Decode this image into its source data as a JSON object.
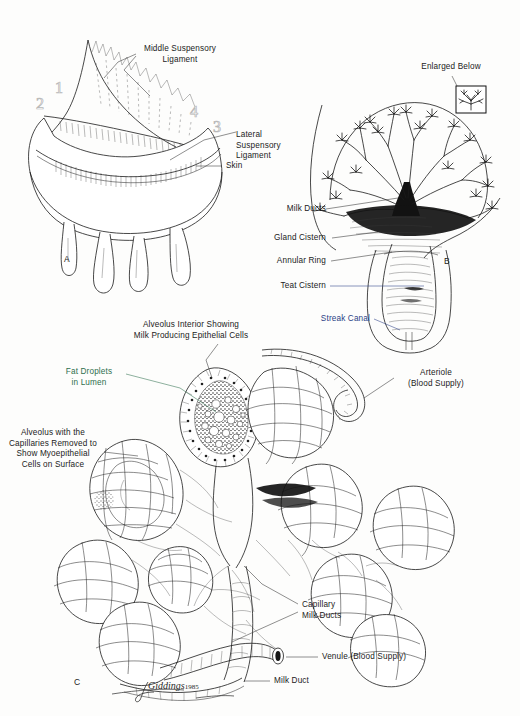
{
  "figure": {
    "artist_signature": "Giddings",
    "artist_year": "1985",
    "background_color": "#fdfdfc",
    "ink_color": "#1a1a1a"
  },
  "panels": [
    {
      "id": "A",
      "letter": "A",
      "caption": "Udder exterior with suspensory ligaments"
    },
    {
      "id": "B",
      "letter": "B",
      "caption": "Gland and teat cross-section"
    },
    {
      "id": "C",
      "letter": "C",
      "caption": "Alveoli with capillary network"
    }
  ],
  "panel_a": {
    "letter": "A",
    "labels": [
      {
        "name": "middle-suspensory-ligament",
        "text": "Middle Suspensory\nLigament",
        "color": "#1b1b1b"
      },
      {
        "name": "lateral-suspensory-ligament",
        "text": "Lateral\nSuspensory\nLigament",
        "color": "#1b1b1b"
      },
      {
        "name": "skin",
        "text": "Skin",
        "color": "#1b1b1b"
      }
    ],
    "callout_numbers": [
      "1",
      "2",
      "3",
      "4"
    ],
    "number_color": "#b9b9b9"
  },
  "panel_b": {
    "letter": "B",
    "labels": [
      {
        "name": "enlarged-below",
        "text": "Enlarged Below",
        "color": "#1b1b1b"
      },
      {
        "name": "milk-ducts",
        "text": "Milk Ducts",
        "color": "#1b1b1b"
      },
      {
        "name": "gland-cistern",
        "text": "Gland Cistern",
        "color": "#1b1b1b"
      },
      {
        "name": "annular-ring",
        "text": "Annular Ring",
        "color": "#1b1b1b"
      },
      {
        "name": "teat-cistern",
        "text": "Teat Cistern",
        "color": "#1b1b1b"
      },
      {
        "name": "streak-canal",
        "text": "Streak Canal",
        "color": "#2a3f86"
      }
    ]
  },
  "panel_c": {
    "letter": "C",
    "labels": [
      {
        "name": "alveolus-interior",
        "text": "Alveolus Interior Showing\nMilk Producing Epithelial Cells",
        "color": "#1b1b1b"
      },
      {
        "name": "fat-droplets",
        "text": "Fat Droplets\nin Lumen",
        "color": "#2f6f4e"
      },
      {
        "name": "alveolus-capillaries-removed",
        "text": "Alveolus with the\nCapillaries Removed to\nShow Myoepithelial\nCells on Surface",
        "color": "#1b1b1b"
      },
      {
        "name": "arteriole",
        "text": "Arteriole\n(Blood Supply)",
        "color": "#1b1b1b"
      },
      {
        "name": "capillary-milk-ducts",
        "text": "Capillary\nMilk Ducts",
        "color": "#1b1b1b"
      },
      {
        "name": "venule",
        "text": "Venule (Blood Supply)",
        "color": "#1b1b1b"
      },
      {
        "name": "milk-duct",
        "text": "Milk Duct",
        "color": "#1b1b1b"
      }
    ]
  },
  "text": {
    "a_middle_susp": "Middle Suspensory\nLigament",
    "a_lateral_susp": "Lateral\nSuspensory\nLigament",
    "a_skin": "Skin",
    "a_n1": "1",
    "a_n2": "2",
    "a_n3": "3",
    "a_n4": "4",
    "a_letter": "A",
    "b_enlarged": "Enlarged Below",
    "b_milk_ducts": "Milk Ducts",
    "b_gland_cistern": "Gland Cistern",
    "b_annular_ring": "Annular Ring",
    "b_teat_cistern": "Teat Cistern",
    "b_streak_canal": "Streak Canal",
    "b_letter": "B",
    "c_alveolus_interior": "Alveolus Interior Showing\nMilk Producing Epithelial Cells",
    "c_fat_droplets": "Fat Droplets\nin Lumen",
    "c_alveolus_removed": "Alveolus with the\nCapillaries Removed to\nShow Myoepithelial\nCells on Surface",
    "c_arteriole": "Arteriole\n(Blood Supply)",
    "c_capillary_ducts": "Capillary\nMilk Ducts",
    "c_venule": "Venule (Blood Supply)",
    "c_milk_duct": "Milk Duct",
    "c_letter": "C",
    "signature": "Giddings",
    "signature_year": "1985"
  }
}
